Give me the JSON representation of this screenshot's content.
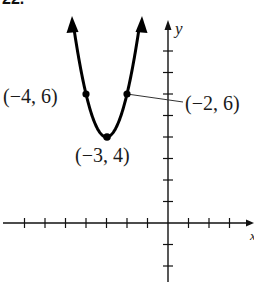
{
  "header": {
    "problem_number": "22."
  },
  "axes": {
    "x_label": "x",
    "y_label": "y",
    "origin_px": [
      168,
      223
    ],
    "unit_px_x": 20.5,
    "unit_px_y": 21.5,
    "x_ticks": [
      -7,
      -6,
      -5,
      -4,
      -3,
      -2,
      -1,
      1,
      2,
      3
    ],
    "y_ticks": [
      -2,
      -1,
      1,
      2,
      3,
      4,
      5,
      6,
      7,
      8
    ]
  },
  "curve": {
    "type": "parabola",
    "equation": "y = 2(x + 3)^2 + 4",
    "vertex": [
      -3,
      4
    ],
    "color": "#000000"
  },
  "points": [
    {
      "label": "(−4, 6)",
      "x": -4,
      "y": 6
    },
    {
      "label": "(−2, 6)",
      "x": -2,
      "y": 6
    },
    {
      "label": "(−3, 4)",
      "x": -3,
      "y": 4
    }
  ],
  "chart_data": {
    "type": "line",
    "title": "",
    "xlabel": "x",
    "ylabel": "y",
    "series": [
      {
        "name": "y = 2(x+3)^2 + 4",
        "x": [
          -4.65,
          -4,
          -3.5,
          -3,
          -2.5,
          -2,
          -1.35
        ],
        "y": [
          9.45,
          6,
          4.5,
          4,
          4.5,
          6,
          9.45
        ]
      }
    ],
    "annotations": [
      "(−4, 6)",
      "(−2, 6)",
      "(−3, 4)"
    ],
    "xlim": [
      -8,
      4
    ],
    "ylim": [
      -3,
      9.5
    ],
    "grid": false
  }
}
